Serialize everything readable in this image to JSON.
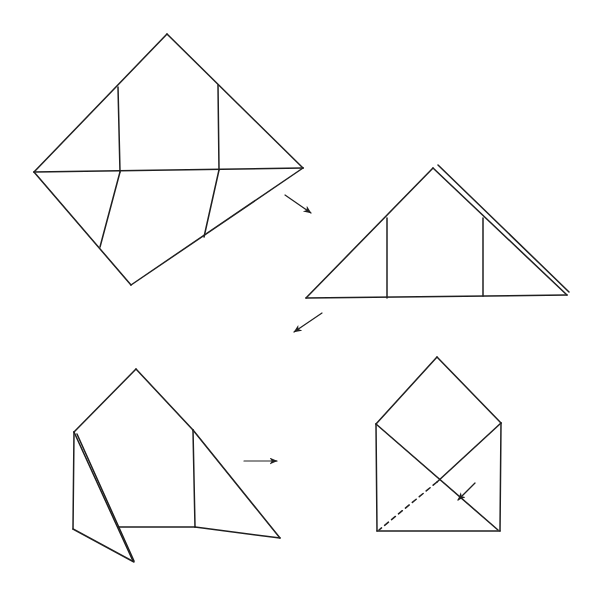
{
  "canvas": {
    "width": 602,
    "height": 596,
    "background": "#ffffff",
    "line_color": "#1f1f1f",
    "line_width": 1.5
  },
  "figures": [
    {
      "id": "step-1-creased-square",
      "lines": [
        {
          "x1": 167,
          "y1": 34,
          "x2": 303,
          "y2": 168
        },
        {
          "x1": 303,
          "y1": 168,
          "x2": 131,
          "y2": 285
        },
        {
          "x1": 131,
          "y1": 285,
          "x2": 34,
          "y2": 172
        },
        {
          "x1": 34,
          "y1": 172,
          "x2": 167,
          "y2": 34
        },
        {
          "x1": 34,
          "y1": 172,
          "x2": 303,
          "y2": 168
        },
        {
          "x1": 118,
          "y1": 87,
          "x2": 120,
          "y2": 172
        },
        {
          "x1": 218,
          "y1": 85,
          "x2": 219,
          "y2": 170
        },
        {
          "x1": 120,
          "y1": 172,
          "x2": 100,
          "y2": 247
        },
        {
          "x1": 219,
          "y1": 170,
          "x2": 204,
          "y2": 237
        }
      ]
    },
    {
      "id": "step-2-folded-triangle",
      "lines": [
        {
          "x1": 433,
          "y1": 168,
          "x2": 306,
          "y2": 298
        },
        {
          "x1": 306,
          "y1": 298,
          "x2": 567,
          "y2": 295
        },
        {
          "x1": 433,
          "y1": 168,
          "x2": 567,
          "y2": 295
        },
        {
          "x1": 438,
          "y1": 165,
          "x2": 569,
          "y2": 292
        },
        {
          "x1": 387,
          "y1": 218,
          "x2": 387,
          "y2": 298
        },
        {
          "x1": 483,
          "y1": 218,
          "x2": 483,
          "y2": 296
        }
      ]
    },
    {
      "id": "step-3-side-flaps-folded",
      "lines": [
        {
          "x1": 136,
          "y1": 369,
          "x2": 74,
          "y2": 432
        },
        {
          "x1": 136,
          "y1": 369,
          "x2": 193,
          "y2": 430
        },
        {
          "x1": 74,
          "y1": 432,
          "x2": 73,
          "y2": 529
        },
        {
          "x1": 73,
          "y1": 529,
          "x2": 134,
          "y2": 562
        },
        {
          "x1": 74,
          "y1": 432,
          "x2": 133,
          "y2": 561
        },
        {
          "x1": 77,
          "y1": 434,
          "x2": 134,
          "y2": 561
        },
        {
          "x1": 118,
          "y1": 527,
          "x2": 195,
          "y2": 527
        },
        {
          "x1": 193,
          "y1": 430,
          "x2": 195,
          "y2": 527
        },
        {
          "x1": 193,
          "y1": 430,
          "x2": 280,
          "y2": 538
        },
        {
          "x1": 195,
          "y1": 527,
          "x2": 280,
          "y2": 538
        }
      ]
    },
    {
      "id": "step-4-envelope",
      "lines": [
        {
          "x1": 437,
          "y1": 357,
          "x2": 376,
          "y2": 424
        },
        {
          "x1": 437,
          "y1": 357,
          "x2": 501,
          "y2": 423
        },
        {
          "x1": 376,
          "y1": 424,
          "x2": 377,
          "y2": 531
        },
        {
          "x1": 501,
          "y1": 423,
          "x2": 500,
          "y2": 531
        },
        {
          "x1": 377,
          "y1": 531,
          "x2": 500,
          "y2": 531
        },
        {
          "x1": 376,
          "y1": 424,
          "x2": 498,
          "y2": 530
        },
        {
          "x1": 501,
          "y1": 423,
          "x2": 437,
          "y2": 482
        },
        {
          "x1": 437,
          "y1": 482,
          "x2": 379,
          "y2": 530,
          "dashed": true
        }
      ]
    }
  ],
  "arrows": [
    {
      "id": "arrow-step1-to-step2",
      "x1": 285,
      "y1": 195,
      "x2": 311,
      "y2": 213
    },
    {
      "id": "arrow-step2-to-step3",
      "x1": 322,
      "y1": 313,
      "x2": 294,
      "y2": 332
    },
    {
      "id": "arrow-step3-to-step4",
      "x1": 244,
      "y1": 461,
      "x2": 277,
      "y2": 461
    },
    {
      "id": "fold-direction-arrow",
      "x1": 475,
      "y1": 483,
      "x2": 458,
      "y2": 500
    }
  ]
}
